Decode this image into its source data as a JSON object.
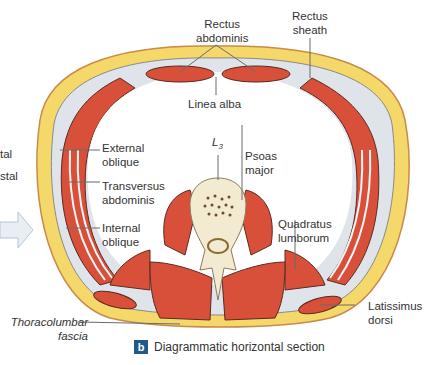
{
  "figure": {
    "panel_letter": "b",
    "caption": "Diagrammatic horizontal section",
    "colors": {
      "skin_border": "#c98a4a",
      "fat": "#f4d86a",
      "muscle": "#d9503a",
      "fascia": "#dfe4ea",
      "bone": "#f3ead2",
      "badge": "#1f5a8c",
      "arrow": "#e8eef3"
    },
    "partial_left_labels": [
      "tal",
      "stal"
    ],
    "labels": {
      "rectus_abdominis": [
        "Rectus",
        "abdominis"
      ],
      "rectus_sheath": [
        "Rectus",
        "sheath"
      ],
      "linea_alba": "Linea alba",
      "external_oblique": [
        "External",
        "oblique"
      ],
      "transversus_abdominis": [
        "Transversus",
        "abdominis"
      ],
      "internal_oblique": [
        "Internal",
        "oblique"
      ],
      "l3": "L",
      "l3_sub": "3",
      "psoas_major": [
        "Psoas",
        "major"
      ],
      "quadratus_lumborum": [
        "Quadratus",
        "lumborum"
      ],
      "latissimus_dorsi": [
        "Latissimus",
        "dorsi"
      ],
      "thoracolumbar_fascia": [
        "Thoracolumbar",
        "fascia"
      ]
    }
  }
}
